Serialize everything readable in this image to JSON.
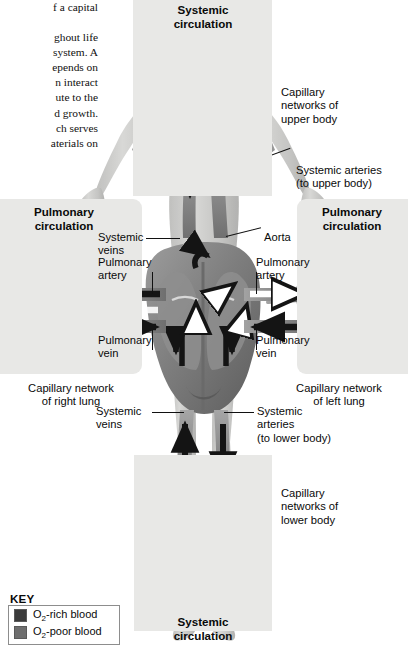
{
  "page": {
    "body_text_lines": [
      "f a capital",
      "ghout life",
      "system. A",
      "epends on",
      "n  interact",
      "ute  to  the",
      "d growth.",
      "ch  serves",
      "aterials on"
    ]
  },
  "panels": {
    "systemic_top": "Systemic\ncirculation",
    "systemic_top_l1": "Systemic",
    "systemic_top_l2": "circulation",
    "systemic_bottom_l1": "Systemic",
    "systemic_bottom_l2": "circulation",
    "pulmonary_left_l1": "Pulmonary",
    "pulmonary_left_l2": "circulation",
    "pulmonary_right_l1": "Pulmonary",
    "pulmonary_right_l2": "circulation"
  },
  "labels": {
    "cap_upper": "Capillary\nnetworks of\nupper body",
    "cap_upper_l1": "Capillary",
    "cap_upper_l2": "networks of",
    "cap_upper_l3": "upper body",
    "sys_art_upper_l1": "Systemic arteries",
    "sys_art_upper_l2": "(to upper body)",
    "sys_veins_upper_l1": "Systemic",
    "sys_veins_upper_l2": "veins",
    "pulm_artery_left_l1": "Pulmonary",
    "pulm_artery_left_l2": "artery",
    "pulm_vein_left_l1": "Pulmonary",
    "pulm_vein_left_l2": "vein",
    "aorta": "Aorta",
    "pulm_artery_right_l1": "Pulmonary",
    "pulm_artery_right_l2": "artery",
    "pulm_vein_right_l1": "Pulmonary",
    "pulm_vein_right_l2": "vein",
    "cap_right_lung_l1": "Capillary network",
    "cap_right_lung_l2": "of right lung",
    "cap_left_lung_l1": "Capillary network",
    "cap_left_lung_l2": "of left lung",
    "sys_veins_lower_l1": "Systemic",
    "sys_veins_lower_l2": "veins",
    "sys_art_lower_l1": "Systemic",
    "sys_art_lower_l2": "arteries",
    "sys_art_lower_l3": "(to lower body)",
    "cap_lower_l1": "Capillary",
    "cap_lower_l2": "networks of",
    "cap_lower_l3": "lower body"
  },
  "key": {
    "title": "KEY",
    "rich_label_pre": "O",
    "rich_label_sub": "2",
    "rich_label_post": "-rich blood",
    "poor_label_pre": "O",
    "poor_label_sub": "2",
    "poor_label_post": "-poor blood",
    "rich_color": "#3b3b3b",
    "poor_color": "#6e6e6e"
  },
  "colors": {
    "panel_gray": "#e8e8e6",
    "vessel_gray": "#8f8f8f",
    "vessel_dark": "#6b6b6b",
    "body_gray": "#c9c9c7",
    "heart_mid": "#9a9a9a",
    "heart_dark": "#5c5c5c",
    "ink": "#0a0a0a"
  }
}
